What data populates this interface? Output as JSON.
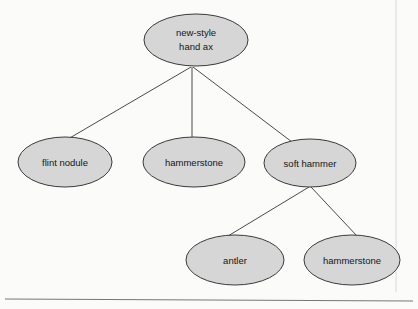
{
  "diagram": {
    "type": "tree",
    "title": "",
    "nodes": [
      {
        "id": "root",
        "label": "new-style hand ax",
        "lines": [
          "new-style",
          "hand ax"
        ],
        "cx": 196,
        "cy": 40,
        "rx": 52,
        "ry": 26,
        "level": 0
      },
      {
        "id": "flint",
        "label": "flint nodule",
        "lines": [
          "flint nodule"
        ],
        "cx": 65,
        "cy": 162,
        "rx": 47,
        "ry": 25,
        "level": 1
      },
      {
        "id": "hammer1",
        "label": "hammerstone",
        "lines": [
          "hammerstone"
        ],
        "cx": 194,
        "cy": 162,
        "rx": 51,
        "ry": 25,
        "level": 1
      },
      {
        "id": "softhammer",
        "label": "soft hammer",
        "lines": [
          "soft hammer"
        ],
        "cx": 310,
        "cy": 163,
        "rx": 46,
        "ry": 24,
        "level": 1
      },
      {
        "id": "antler",
        "label": "antler",
        "lines": [
          "antler"
        ],
        "cx": 235,
        "cy": 260,
        "rx": 49,
        "ry": 25,
        "level": 2
      },
      {
        "id": "hammer2",
        "label": "hammerstone",
        "lines": [
          "hammerstone"
        ],
        "cx": 352,
        "cy": 260,
        "rx": 48,
        "ry": 25,
        "level": 2
      }
    ],
    "edges": [
      {
        "from": "root",
        "to": "flint",
        "x1": 191,
        "y1": 67,
        "x2": 68,
        "y2": 139
      },
      {
        "from": "root",
        "to": "hammer1",
        "x1": 192,
        "y1": 67,
        "x2": 192,
        "y2": 138
      },
      {
        "from": "root",
        "to": "softhammer",
        "x1": 193,
        "y1": 67,
        "x2": 292,
        "y2": 142
      },
      {
        "from": "softhammer",
        "to": "antler",
        "x1": 309,
        "y1": 187,
        "x2": 228,
        "y2": 236
      },
      {
        "from": "softhammer",
        "to": "hammer2",
        "x1": 311,
        "y1": 187,
        "x2": 357,
        "y2": 236
      }
    ],
    "rules": [
      {
        "name": "bottom-rule",
        "x1": 5,
        "y1": 299,
        "x2": 413,
        "y2": 301
      },
      {
        "name": "right-edge-rule",
        "x1": 396,
        "y1": 0,
        "x2": 396,
        "y2": 292
      }
    ],
    "colors": {
      "node_fill": "#d6d6d6",
      "node_stroke": "#3a3a3a",
      "edge_stroke": "#4a4a4a",
      "label_text": "#151515",
      "background": "#fbfbfa",
      "rule": "#777777"
    }
  }
}
